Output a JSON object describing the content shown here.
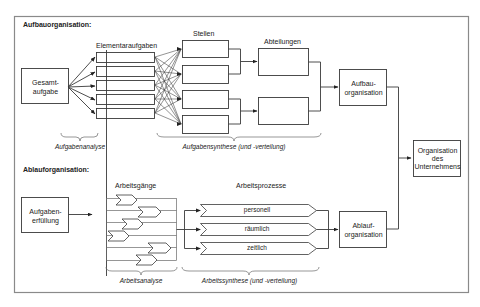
{
  "sections": {
    "aufbau": {
      "title": "Aufbauorganisation:",
      "start_box": [
        "Gesamt-",
        "aufgabe"
      ],
      "column_elementary": "Elementaraufgaben",
      "column_positions": "Stellen",
      "column_departments": "Abteilungen",
      "result_box": [
        "Aufbau-",
        "organisation"
      ],
      "brace_analysis": "Aufgabenanalyse",
      "brace_synthesis": "Aufgabensynthese (und -verteilung)"
    },
    "ablauf": {
      "title": "Ablauforganisation:",
      "start_box": [
        "Aufgaben-",
        "erfüllung"
      ],
      "column_workflows": "Arbeitsgänge",
      "column_processes": "Arbeitsprozesse",
      "processes": [
        "personell",
        "räumlich",
        "zeitlich"
      ],
      "result_box": [
        "Ablauf-",
        "organisation"
      ],
      "brace_analysis": "Arbeitsanalyse",
      "brace_synthesis": "Arbeitssynthese (und -verteilung)"
    },
    "final_box": [
      "Organisation",
      "des",
      "Unternehmens"
    ]
  },
  "colors": {
    "line": "#3a3a3a",
    "frame": "#8a8a8a",
    "text": "#222222",
    "background": "#ffffff"
  }
}
